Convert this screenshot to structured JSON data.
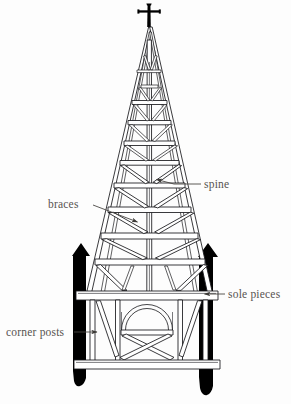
{
  "figure": {
    "kind": "architectural-line-drawing",
    "background_color": "#fdfdfd",
    "ink_color": "#17171a",
    "label_color": "#575350",
    "solid_fill_color": "#000000"
  },
  "labels": [
    {
      "id": "spine",
      "text": "spine",
      "text_x": 204,
      "text_y": 188,
      "leader": "M 200 184 L 174 184 M 174 184 L 155 179",
      "arrow_at": [
        155,
        179
      ],
      "arrow_angle": 195
    },
    {
      "id": "braces",
      "text": "braces",
      "text_x": 48,
      "text_y": 208,
      "leader": "M 92 206 L 137 222",
      "arrow_at": [
        137,
        222
      ],
      "arrow_angle": 19
    },
    {
      "id": "sole-pieces",
      "text": "sole pieces",
      "text_x": 228,
      "text_y": 298,
      "leader": "M 224 294 L 203 294",
      "arrow_at": [
        203,
        294
      ],
      "arrow_angle": 180
    },
    {
      "id": "corner-posts",
      "text": "corner posts",
      "text_x": 6,
      "text_y": 336,
      "leader": "M 74 332 L 96 332",
      "arrow_at": [
        96,
        332
      ],
      "arrow_angle": 0
    }
  ],
  "structure": {
    "finial_cross": {
      "name": "cross-finial",
      "shaft_x": 149,
      "top_y": 3,
      "bottom_y": 27,
      "arm_y": 11,
      "arm_half_width": 11
    },
    "spire": {
      "apex_x": 149,
      "apex_y": 27,
      "base_y": 294,
      "base_left_x": 86,
      "base_right_x": 212,
      "collar_beam_count": 9,
      "spine_label": "spine",
      "collar_beams_y": [
        103,
        123,
        144,
        163,
        186,
        210,
        236,
        262,
        290
      ]
    },
    "belfry": {
      "top_beam_y": 294,
      "bottom_beam_y": 363,
      "left_x": 79,
      "right_x": 214,
      "arch_center_x": 147,
      "arch_radius": 24,
      "arch_spring_y": 330,
      "has_cross_brace": true
    },
    "corner_posts": [
      {
        "side": "left",
        "x": 72,
        "width": 18,
        "top_y": 243,
        "bottom_y": 394
      },
      {
        "side": "right",
        "x": 199,
        "width": 19,
        "top_y": 243,
        "bottom_y": 400
      }
    ]
  }
}
